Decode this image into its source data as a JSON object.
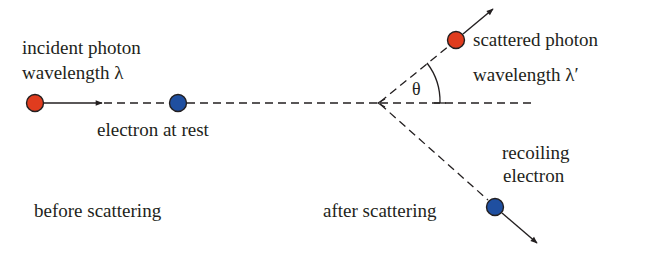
{
  "diagram": {
    "labels": {
      "incident_line1": "incident photon",
      "incident_line2": "wavelength λ",
      "electron_rest": "electron at rest",
      "before": "before scattering",
      "scattered_line1": "scattered photon",
      "scattered_line2": "wavelength λ′",
      "recoil_line1": "recoiling",
      "recoil_line2": "electron",
      "after": "after scattering",
      "angle": "θ"
    },
    "colors": {
      "photon": "#e03c1e",
      "electron": "#1f4fa0",
      "line": "#231f20",
      "text": "#231f20"
    },
    "nodes": [
      {
        "id": "incident-photon",
        "type": "photon",
        "x": 35,
        "y": 103
      },
      {
        "id": "electron-at-rest",
        "type": "electron",
        "x": 178,
        "y": 103
      },
      {
        "id": "scattered-photon",
        "type": "photon",
        "x": 456,
        "y": 40
      },
      {
        "id": "recoiling-electron",
        "type": "electron",
        "x": 495,
        "y": 207
      }
    ],
    "edges": [
      {
        "from": "incident-photon",
        "to": "arrow-head",
        "style": "solid-arrow"
      },
      {
        "from": "arrow-head",
        "to": "electron-at-rest",
        "style": "dashed"
      },
      {
        "from": "electron-at-rest",
        "to": "scatter-point",
        "style": "dashed"
      },
      {
        "from": "scatter-point",
        "to": "scattered-photon",
        "style": "dashed"
      },
      {
        "from": "scattered-photon",
        "to": "out",
        "style": "solid-arrow"
      },
      {
        "from": "scatter-point",
        "to": "recoiling-electron",
        "style": "dashed"
      },
      {
        "from": "recoiling-electron",
        "to": "out",
        "style": "solid-arrow"
      }
    ]
  }
}
